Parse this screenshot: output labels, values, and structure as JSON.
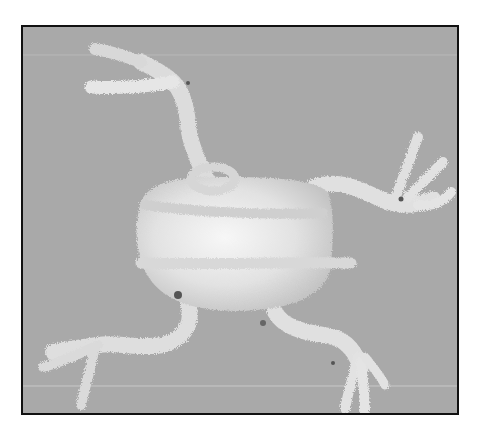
{
  "image": {
    "description": "Grayscale photo of a frog figure crafted from white pipe cleaners on a gray background, inside a black rectangular frame",
    "subject": "pipe-cleaner frog",
    "colors": {
      "background": "#a9a9a9",
      "frame": "#111111",
      "pipe_cleaner": "#ececec",
      "shadow": "#6a6a6a"
    }
  }
}
